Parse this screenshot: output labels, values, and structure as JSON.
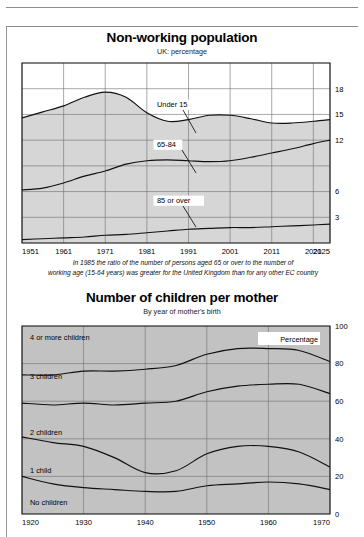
{
  "page": {
    "background": "#ffffff",
    "frame_color": "#8d8d8d"
  },
  "charts": [
    {
      "id": "non-working-population",
      "title": "Non-working population",
      "subtitle": "UK: percentage",
      "caption_line1": "In 1985 the ratio of the number of persons aged 65 or over to the number of",
      "caption_line2": "working age (15-64 years) was greater for the United Kingdom than for any other EC country",
      "band_labels": [
        "Under 15",
        "65-84",
        "85 or over"
      ],
      "x_ticks": [
        "1951",
        "1961",
        "1971",
        "1981",
        "1991",
        "2001",
        "2011",
        "2021",
        "2025"
      ],
      "y_ticks": [
        "18",
        "15",
        "12",
        "6",
        "3"
      ]
    },
    {
      "id": "children-per-mother",
      "title": "Number of children per mother",
      "subtitle": "By year of mother's birth",
      "legend": "Percentage",
      "band_labels": [
        "4 or more children",
        "3 children",
        "2 children",
        "1 child",
        "No children"
      ],
      "x_ticks": [
        "1920",
        "1930",
        "1940",
        "1950",
        "1960",
        "1970"
      ],
      "y_ticks": [
        "100",
        "80",
        "60",
        "40",
        "20",
        "0"
      ]
    }
  ],
  "chart_data": [
    {
      "type": "area",
      "id": "non-working-population",
      "title": "Non-working population",
      "subtitle": "UK: percentage",
      "xlabel": "",
      "ylabel": "Percentage of population",
      "xlim": [
        1951,
        2025
      ],
      "ylim": [
        0,
        21
      ],
      "y_ticks": [
        3,
        6,
        12,
        15,
        18
      ],
      "y_gridlines": [
        3,
        6,
        9,
        12,
        15,
        18
      ],
      "x_gridlines": [
        1951,
        1961,
        1971,
        1981,
        1991,
        2001,
        2011,
        2021,
        2025
      ],
      "grid": true,
      "stacked": true,
      "legend": "inline-labels",
      "colors": {
        "Under 15": "#d6d6d6",
        "65-84": "#9c9c9c",
        "85 or over": "#858585"
      },
      "x": [
        1951,
        1956,
        1961,
        1966,
        1971,
        1976,
        1981,
        1986,
        1991,
        1996,
        2001,
        2006,
        2011,
        2016,
        2021,
        2025
      ],
      "series": [
        {
          "name": "85 or over",
          "values": [
            0.4,
            0.5,
            0.6,
            0.7,
            0.9,
            1.0,
            1.2,
            1.4,
            1.6,
            1.7,
            1.8,
            1.8,
            1.9,
            2.0,
            2.1,
            2.2
          ]
        },
        {
          "name": "65-84",
          "values": [
            6.2,
            6.4,
            7.0,
            7.8,
            8.4,
            9.2,
            9.6,
            9.7,
            9.6,
            9.5,
            9.6,
            10.0,
            10.5,
            11.0,
            11.6,
            12.0
          ]
        },
        {
          "name": "Under 15",
          "values": [
            14.6,
            15.3,
            16.0,
            17.0,
            17.6,
            17.0,
            15.2,
            14.2,
            14.4,
            14.9,
            14.9,
            14.5,
            14.0,
            14.0,
            14.2,
            14.4
          ]
        }
      ],
      "cumulative_tops": {
        "85 or over": [
          0.4,
          0.5,
          0.6,
          0.7,
          0.9,
          1.0,
          1.2,
          1.4,
          1.6,
          1.7,
          1.8,
          1.8,
          1.9,
          2.0,
          2.1,
          2.2
        ],
        "65-84": [
          6.2,
          6.4,
          7.0,
          7.8,
          8.4,
          9.2,
          9.6,
          9.7,
          9.6,
          9.5,
          9.6,
          10.0,
          10.5,
          11.0,
          11.6,
          12.0
        ],
        "Under 15": [
          14.6,
          15.3,
          16.0,
          17.0,
          17.6,
          17.0,
          15.2,
          14.2,
          14.4,
          14.9,
          14.9,
          14.5,
          14.0,
          14.0,
          14.2,
          14.4
        ]
      }
    },
    {
      "type": "area",
      "id": "children-per-mother",
      "title": "Number of children per mother",
      "subtitle": "By year of mother's birth",
      "xlabel": "Year of mother's birth",
      "ylabel": "Percentage",
      "xlim": [
        1920,
        1970
      ],
      "ylim": [
        0,
        100
      ],
      "y_ticks": [
        0,
        20,
        40,
        60,
        80,
        100
      ],
      "y_gridlines": [
        20,
        40,
        60,
        80
      ],
      "x_gridlines": [
        1920,
        1930,
        1940,
        1950,
        1960,
        1970
      ],
      "grid": true,
      "stacked": true,
      "legend": "inline-labels",
      "colors": {
        "No children": "#8f8f8f",
        "1 child": "#a0a0a0",
        "2 children": "#b0b0b0",
        "3 children": "#9a9a9a",
        "4 or more children": "#c2c2c2"
      },
      "x": [
        1920,
        1925,
        1930,
        1935,
        1940,
        1945,
        1950,
        1955,
        1960,
        1965,
        1970
      ],
      "series": [
        {
          "name": "No children",
          "values": [
            20,
            16,
            14,
            13,
            12,
            12,
            15,
            16,
            17,
            16,
            13
          ]
        },
        {
          "name": "1 child",
          "values": [
            21,
            22,
            22,
            17,
            10,
            11,
            17,
            20,
            19,
            17,
            12
          ]
        },
        {
          "name": "2 children",
          "values": [
            18,
            20,
            23,
            28,
            37,
            37,
            33,
            32,
            33,
            36,
            39
          ]
        },
        {
          "name": "3 children",
          "values": [
            15,
            16,
            17,
            18,
            18,
            19,
            20,
            20,
            19,
            18,
            17
          ]
        },
        {
          "name": "4 or more children",
          "values": [
            26,
            26,
            24,
            24,
            23,
            21,
            15,
            12,
            12,
            13,
            19
          ]
        }
      ],
      "cumulative_tops": {
        "No children": [
          20,
          16,
          14,
          13,
          12,
          12,
          15,
          16,
          17,
          16,
          13
        ],
        "1 child": [
          41,
          38,
          36,
          30,
          22,
          23,
          32,
          36,
          36,
          33,
          25
        ],
        "2 children": [
          59,
          58,
          59,
          58,
          59,
          60,
          65,
          68,
          69,
          69,
          64
        ],
        "3 children": [
          74,
          74,
          76,
          76,
          77,
          79,
          85,
          88,
          88,
          87,
          81
        ],
        "4 or more children": [
          100,
          100,
          100,
          100,
          100,
          100,
          100,
          100,
          100,
          100,
          100
        ]
      }
    }
  ]
}
